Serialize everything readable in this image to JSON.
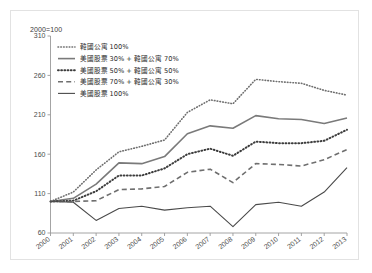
{
  "figure": {
    "index_note": "2000=100",
    "background": "#ffffff",
    "frame_color": "#e2e2e2"
  },
  "chart_data": {
    "type": "line",
    "title": "",
    "subtitle": "",
    "xlabel": "",
    "ylabel": "",
    "index_note": "2000=100",
    "grid": false,
    "legend_position": "top-left",
    "x": [
      2000,
      2001,
      2002,
      2003,
      2004,
      2005,
      2006,
      2007,
      2008,
      2009,
      2010,
      2011,
      2012,
      2013
    ],
    "xtick_labels": [
      "2000",
      "2001",
      "2002",
      "2003",
      "2004",
      "2005",
      "2006",
      "2007",
      "2008",
      "2009",
      "2010",
      "2011",
      "2012",
      "2013"
    ],
    "ytick_labels": [
      "60",
      "110",
      "160",
      "210",
      "260",
      "310"
    ],
    "yticks": [
      60,
      110,
      160,
      210,
      260,
      310
    ],
    "ylim": [
      60,
      310
    ],
    "xlim": [
      2000,
      2013
    ],
    "series": [
      {
        "name": "韓國公寓 100%",
        "style": "fine-dotted",
        "color": "#6f6f6f",
        "width": 1.6,
        "values": [
          100,
          112,
          140,
          163,
          170,
          178,
          213,
          229,
          224,
          255,
          252,
          250,
          241,
          235
        ]
      },
      {
        "name": "美國股票 30% + 韓國公寓 70%",
        "style": "solid",
        "color": "#7a7a7a",
        "width": 1.6,
        "values": [
          100,
          104,
          122,
          149,
          148,
          157,
          186,
          196,
          193,
          209,
          205,
          204,
          199,
          206
        ]
      },
      {
        "name": "美國股票 50% + 韓國公寓 50%",
        "style": "bold-dotted",
        "color": "#3c3c3c",
        "width": 2.0,
        "values": [
          100,
          101,
          113,
          133,
          133,
          142,
          160,
          167,
          158,
          176,
          174,
          174,
          177,
          191
        ]
      },
      {
        "name": "美國股票 70% + 韓國公寓 30%",
        "style": "dashed",
        "color": "#6f6f6f",
        "width": 1.6,
        "values": [
          100,
          100,
          101,
          115,
          116,
          119,
          137,
          141,
          124,
          148,
          147,
          145,
          153,
          166
        ]
      },
      {
        "name": "美國股票 100%",
        "style": "thin-solid",
        "color": "#4a4a4a",
        "width": 1.1,
        "values": [
          100,
          99,
          76,
          91,
          94,
          89,
          92,
          94,
          68,
          96,
          99,
          94,
          112,
          143
        ]
      }
    ]
  }
}
